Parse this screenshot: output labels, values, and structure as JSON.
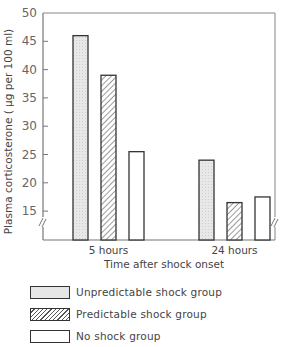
{
  "chart_data": {
    "type": "bar",
    "title": "",
    "xlabel": "Time after shock onset",
    "ylabel": "Plasma corticosterone ( µg per 100 ml)",
    "ylim": [
      10,
      50
    ],
    "yticks": [
      15,
      20,
      25,
      30,
      35,
      40,
      45,
      50
    ],
    "categories": [
      "5 hours",
      "24 hours"
    ],
    "series": [
      {
        "name": "Unpredictable shock group",
        "values": [
          46,
          24
        ],
        "fill": "#e6e6e6",
        "pattern": "stipple"
      },
      {
        "name": "Predictable shock group",
        "values": [
          39,
          16.5
        ],
        "fill": "#ffffff",
        "pattern": "hatched"
      },
      {
        "name": "No shock group",
        "values": [
          25.5,
          17.5
        ],
        "fill": "#ffffff",
        "pattern": "none"
      }
    ],
    "axis_break": true,
    "grid": false,
    "legend_position": "bottom"
  },
  "legend": {
    "items": [
      {
        "label": "Unpredictable shock group"
      },
      {
        "label": "Predictable shock group"
      },
      {
        "label": "No shock group"
      }
    ]
  }
}
